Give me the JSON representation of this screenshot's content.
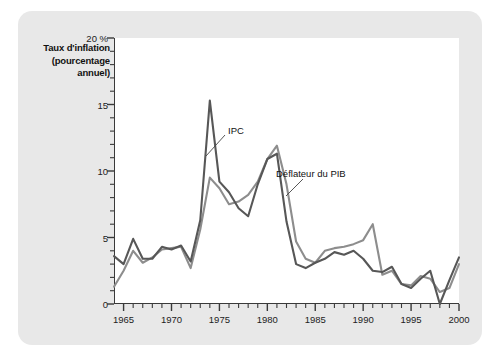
{
  "figure": {
    "background_color": "#e8e8e8",
    "panel_color": "#ffffff",
    "axis_color": "#3a3a3a"
  },
  "axis_title_lines": {
    "line1": "Taux d'inflation",
    "line2": "(pourcentage",
    "line3": "annuel)"
  },
  "annotations": {
    "ipc": "IPC",
    "deflator": "Déflateur du PIB"
  },
  "chart_data": {
    "type": "line",
    "title": "Taux d'inflation (pourcentage annuel)",
    "xlabel": "",
    "ylabel": "Taux d'inflation (pourcentage annuel)",
    "xlim": [
      1964,
      2000
    ],
    "ylim": [
      0,
      20
    ],
    "yticks": [
      0,
      5,
      10,
      15,
      20
    ],
    "ytick_labels": [
      "0",
      "5",
      "10",
      "15",
      "20 %"
    ],
    "xticks": [
      1965,
      1970,
      1975,
      1980,
      1985,
      1990,
      1995,
      2000
    ],
    "xtick_labels": [
      "1965",
      "1970",
      "1975",
      "1980",
      "1985",
      "1990",
      "1995",
      "2000"
    ],
    "minor_xtick_interval": 1,
    "grid": false,
    "legend": "inline annotations",
    "x": [
      1964,
      1965,
      1966,
      1967,
      1968,
      1969,
      1970,
      1971,
      1972,
      1973,
      1974,
      1975,
      1976,
      1977,
      1978,
      1979,
      1980,
      1981,
      1982,
      1983,
      1984,
      1985,
      1986,
      1987,
      1988,
      1989,
      1990,
      1991,
      1992,
      1993,
      1994,
      1995,
      1996,
      1997,
      1998,
      1999,
      2000
    ],
    "series": [
      {
        "name": "IPC",
        "color": "#575757",
        "values": [
          3.6,
          3.0,
          4.9,
          3.4,
          3.4,
          4.3,
          4.1,
          4.4,
          3.2,
          6.3,
          15.3,
          9.2,
          8.4,
          7.2,
          6.6,
          9.0,
          10.9,
          11.3,
          6.2,
          3.0,
          2.7,
          3.1,
          3.4,
          3.9,
          3.7,
          4.0,
          3.4,
          2.5,
          2.4,
          2.8,
          1.5,
          1.2,
          1.9,
          2.5,
          0.0,
          1.8,
          3.5
        ]
      },
      {
        "name": "Déflateur du PIB",
        "color": "#8d8d8d",
        "values": [
          1.3,
          2.5,
          4.0,
          3.1,
          3.5,
          4.1,
          4.2,
          4.3,
          2.7,
          5.6,
          9.5,
          8.7,
          7.5,
          7.7,
          8.2,
          9.2,
          10.9,
          11.9,
          9.0,
          4.7,
          3.4,
          3.1,
          4.0,
          4.2,
          4.3,
          4.5,
          4.8,
          6.0,
          2.2,
          2.5,
          1.5,
          1.4,
          2.1,
          1.9,
          0.9,
          1.2,
          3.0
        ]
      }
    ]
  }
}
